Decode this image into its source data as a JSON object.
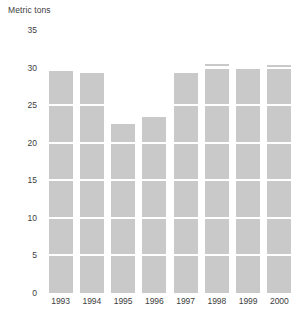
{
  "chart_data": {
    "type": "bar",
    "title": "",
    "ylabel": "Metric tons",
    "xlabel": "",
    "categories": [
      "1993",
      "1994",
      "1995",
      "1996",
      "1997",
      "1998",
      "1999",
      "2000"
    ],
    "values": [
      29.6,
      29.3,
      22.5,
      23.4,
      29.3,
      30.5,
      30.0,
      30.4
    ],
    "segment_marks": [
      null,
      null,
      null,
      null,
      null,
      30.0,
      null,
      null
    ],
    "ylim": [
      0,
      35
    ],
    "yticks": [
      0,
      5,
      10,
      15,
      20,
      25,
      30,
      35
    ],
    "ytick_labels": [
      "0",
      "5",
      "10",
      "15",
      "20",
      "25",
      "30",
      "35"
    ],
    "grid": "horizontal-white-lines",
    "legend": "none",
    "bar_color": "#c9c9c9",
    "grid_color": "#ffffff",
    "background_color": "#ffffff",
    "text_color": "#3d3d3d"
  }
}
